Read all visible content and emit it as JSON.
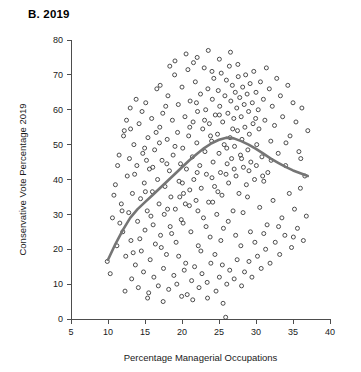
{
  "panel": {
    "title": "B. 2019"
  },
  "chart_data": {
    "type": "scatter",
    "title": "B. 2019",
    "xlabel": "Percentage Managerial Occupations",
    "ylabel": "Conservative Vote Percentage 2019",
    "xlim": [
      5,
      40
    ],
    "ylim": [
      0,
      80
    ],
    "xticks": [
      5,
      10,
      15,
      20,
      25,
      30,
      35,
      40
    ],
    "yticks": [
      0,
      10,
      20,
      30,
      40,
      50,
      60,
      70,
      80
    ],
    "grid": false,
    "legend": null,
    "marker": {
      "shape": "open-circle",
      "size": 4,
      "stroke_color": "#3a3a3a",
      "fill": "none"
    },
    "trend_line": {
      "label": "loess-smoother",
      "color": "#757575",
      "width": 2.6,
      "points": [
        [
          10.0,
          17.0
        ],
        [
          11.0,
          21.5
        ],
        [
          12.0,
          25.5
        ],
        [
          13.0,
          29.0
        ],
        [
          14.0,
          31.5
        ],
        [
          15.0,
          33.5
        ],
        [
          16.0,
          35.5
        ],
        [
          17.0,
          37.5
        ],
        [
          18.0,
          39.5
        ],
        [
          19.0,
          41.5
        ],
        [
          20.0,
          43.5
        ],
        [
          21.0,
          45.5
        ],
        [
          22.0,
          47.3
        ],
        [
          23.0,
          49.0
        ],
        [
          24.0,
          50.4
        ],
        [
          25.0,
          51.4
        ],
        [
          26.0,
          52.0
        ],
        [
          27.0,
          51.8
        ],
        [
          28.0,
          51.0
        ],
        [
          29.0,
          50.0
        ],
        [
          30.0,
          48.8
        ],
        [
          31.0,
          47.4
        ],
        [
          32.0,
          46.0
        ],
        [
          33.0,
          44.8
        ],
        [
          34.0,
          43.6
        ],
        [
          35.0,
          42.6
        ],
        [
          36.0,
          41.8
        ],
        [
          37.0,
          41.0
        ]
      ]
    },
    "points": [
      [
        9.9,
        16.5
      ],
      [
        10.3,
        13.0
      ],
      [
        10.6,
        29.0
      ],
      [
        11.0,
        38.5
      ],
      [
        11.2,
        21.0
      ],
      [
        11.5,
        47.0
      ],
      [
        11.8,
        33.0
      ],
      [
        12.0,
        25.0
      ],
      [
        12.2,
        54.0
      ],
      [
        12.4,
        18.0
      ],
      [
        12.6,
        41.0
      ],
      [
        12.8,
        30.5
      ],
      [
        13.0,
        60.5
      ],
      [
        13.1,
        22.5
      ],
      [
        13.3,
        36.0
      ],
      [
        13.5,
        50.0
      ],
      [
        13.7,
        15.5
      ],
      [
        13.9,
        44.0
      ],
      [
        14.0,
        28.0
      ],
      [
        14.2,
        56.0
      ],
      [
        14.4,
        34.5
      ],
      [
        14.5,
        19.5
      ],
      [
        14.7,
        47.5
      ],
      [
        14.9,
        39.0
      ],
      [
        15.0,
        25.5
      ],
      [
        15.1,
        62.0
      ],
      [
        15.3,
        31.0
      ],
      [
        15.4,
        52.0
      ],
      [
        15.6,
        43.0
      ],
      [
        15.7,
        17.0
      ],
      [
        15.9,
        57.5
      ],
      [
        16.0,
        36.5
      ],
      [
        16.1,
        27.0
      ],
      [
        16.3,
        48.5
      ],
      [
        16.4,
        21.5
      ],
      [
        16.6,
        66.0
      ],
      [
        16.7,
        40.0
      ],
      [
        16.9,
        33.0
      ],
      [
        17.0,
        55.0
      ],
      [
        17.1,
        24.0
      ],
      [
        17.3,
        45.5
      ],
      [
        17.4,
        59.0
      ],
      [
        17.6,
        30.0
      ],
      [
        17.7,
        38.0
      ],
      [
        17.9,
        18.5
      ],
      [
        18.0,
        51.5
      ],
      [
        18.1,
        64.0
      ],
      [
        18.3,
        42.5
      ],
      [
        18.4,
        26.5
      ],
      [
        18.5,
        35.0
      ],
      [
        18.7,
        57.0
      ],
      [
        18.8,
        47.0
      ],
      [
        19.0,
        70.0
      ],
      [
        19.1,
        31.5
      ],
      [
        19.2,
        22.0
      ],
      [
        19.4,
        53.5
      ],
      [
        19.5,
        61.5
      ],
      [
        19.6,
        39.5
      ],
      [
        19.8,
        44.5
      ],
      [
        19.9,
        28.5
      ],
      [
        20.0,
        66.5
      ],
      [
        20.1,
        49.0
      ],
      [
        20.2,
        36.0
      ],
      [
        20.4,
        58.0
      ],
      [
        20.5,
        16.0
      ],
      [
        20.6,
        43.0
      ],
      [
        20.8,
        71.5
      ],
      [
        20.9,
        52.5
      ],
      [
        21.0,
        32.5
      ],
      [
        21.1,
        62.5
      ],
      [
        21.2,
        25.0
      ],
      [
        21.4,
        46.5
      ],
      [
        21.5,
        56.5
      ],
      [
        21.6,
        40.0
      ],
      [
        21.8,
        68.0
      ],
      [
        21.9,
        34.0
      ],
      [
        22.0,
        50.5
      ],
      [
        22.1,
        59.5
      ],
      [
        22.2,
        21.0
      ],
      [
        22.4,
        44.0
      ],
      [
        22.5,
        64.5
      ],
      [
        22.6,
        37.5
      ],
      [
        22.8,
        54.5
      ],
      [
        22.9,
        29.0
      ],
      [
        23.0,
        72.0
      ],
      [
        23.1,
        48.0
      ],
      [
        23.2,
        60.0
      ],
      [
        23.3,
        41.5
      ],
      [
        23.5,
        66.0
      ],
      [
        23.6,
        33.5
      ],
      [
        23.7,
        56.0
      ],
      [
        23.8,
        23.5
      ],
      [
        24.0,
        51.0
      ],
      [
        24.1,
        63.0
      ],
      [
        24.2,
        45.0
      ],
      [
        24.3,
        69.0
      ],
      [
        24.4,
        38.0
      ],
      [
        24.5,
        58.5
      ],
      [
        24.7,
        30.0
      ],
      [
        24.8,
        53.0
      ],
      [
        24.9,
        65.5
      ],
      [
        25.0,
        47.5
      ],
      [
        25.1,
        61.0
      ],
      [
        25.2,
        42.0
      ],
      [
        25.3,
        70.5
      ],
      [
        25.4,
        35.5
      ],
      [
        25.5,
        56.5
      ],
      [
        25.6,
        26.0
      ],
      [
        25.7,
        50.0
      ],
      [
        25.8,
        64.0
      ],
      [
        25.9,
        0.5
      ],
      [
        26.0,
        68.5
      ],
      [
        26.1,
        44.5
      ],
      [
        26.2,
        59.0
      ],
      [
        26.3,
        39.0
      ],
      [
        26.4,
        72.5
      ],
      [
        26.5,
        52.0
      ],
      [
        26.6,
        62.5
      ],
      [
        26.7,
        46.0
      ],
      [
        26.8,
        67.0
      ],
      [
        26.9,
        31.0
      ],
      [
        27.0,
        57.5
      ],
      [
        27.1,
        49.5
      ],
      [
        27.2,
        65.0
      ],
      [
        27.3,
        41.0
      ],
      [
        27.4,
        60.5
      ],
      [
        27.5,
        54.0
      ],
      [
        27.6,
        69.5
      ],
      [
        27.7,
        36.0
      ],
      [
        27.8,
        63.5
      ],
      [
        27.9,
        47.0
      ],
      [
        28.0,
        58.0
      ],
      [
        28.1,
        51.5
      ],
      [
        28.2,
        66.5
      ],
      [
        28.3,
        43.5
      ],
      [
        28.4,
        61.5
      ],
      [
        28.5,
        55.0
      ],
      [
        28.6,
        70.0
      ],
      [
        28.7,
        38.5
      ],
      [
        28.8,
        64.5
      ],
      [
        28.9,
        48.5
      ],
      [
        29.0,
        59.5
      ],
      [
        29.1,
        53.0
      ],
      [
        29.2,
        67.5
      ],
      [
        29.3,
        45.0
      ],
      [
        29.5,
        62.0
      ],
      [
        29.6,
        56.0
      ],
      [
        29.7,
        71.0
      ],
      [
        29.8,
        40.0
      ],
      [
        30.0,
        65.0
      ],
      [
        30.1,
        50.0
      ],
      [
        30.3,
        60.0
      ],
      [
        30.4,
        54.5
      ],
      [
        30.6,
        68.0
      ],
      [
        30.8,
        46.5
      ],
      [
        31.0,
        63.0
      ],
      [
        31.2,
        57.0
      ],
      [
        31.4,
        72.0
      ],
      [
        31.6,
        42.0
      ],
      [
        31.8,
        66.0
      ],
      [
        32.0,
        51.0
      ],
      [
        32.2,
        61.0
      ],
      [
        32.5,
        55.5
      ],
      [
        32.8,
        69.0
      ],
      [
        33.0,
        47.5
      ],
      [
        33.3,
        64.0
      ],
      [
        33.6,
        58.0
      ],
      [
        34.0,
        44.0
      ],
      [
        34.3,
        67.0
      ],
      [
        34.6,
        52.5
      ],
      [
        35.0,
        62.0
      ],
      [
        35.4,
        56.5
      ],
      [
        35.8,
        48.0
      ],
      [
        36.2,
        60.5
      ],
      [
        36.6,
        41.0
      ],
      [
        37.0,
        54.0
      ],
      [
        12.3,
        8.0
      ],
      [
        13.2,
        11.5
      ],
      [
        14.1,
        9.0
      ],
      [
        14.8,
        13.5
      ],
      [
        15.5,
        7.5
      ],
      [
        16.2,
        12.0
      ],
      [
        16.8,
        9.5
      ],
      [
        17.5,
        14.5
      ],
      [
        18.2,
        8.5
      ],
      [
        18.9,
        12.5
      ],
      [
        19.3,
        10.0
      ],
      [
        20.3,
        14.0
      ],
      [
        20.7,
        7.0
      ],
      [
        21.3,
        11.0
      ],
      [
        21.7,
        15.0
      ],
      [
        22.3,
        9.0
      ],
      [
        22.7,
        13.0
      ],
      [
        23.4,
        10.5
      ],
      [
        23.9,
        16.0
      ],
      [
        24.6,
        8.0
      ],
      [
        25.05,
        12.0
      ],
      [
        25.45,
        15.5
      ],
      [
        26.05,
        10.0
      ],
      [
        26.45,
        14.0
      ],
      [
        27.05,
        11.5
      ],
      [
        27.45,
        17.0
      ],
      [
        28.05,
        9.5
      ],
      [
        28.45,
        13.5
      ],
      [
        29.05,
        16.5
      ],
      [
        29.45,
        12.0
      ],
      [
        30.2,
        18.0
      ],
      [
        30.7,
        14.5
      ],
      [
        31.3,
        20.0
      ],
      [
        31.9,
        16.0
      ],
      [
        32.6,
        22.0
      ],
      [
        33.2,
        18.5
      ],
      [
        33.9,
        24.0
      ],
      [
        34.8,
        20.5
      ],
      [
        35.6,
        26.0
      ],
      [
        36.4,
        22.5
      ],
      [
        11.3,
        44.0
      ],
      [
        12.1,
        52.5
      ],
      [
        13.4,
        19.0
      ],
      [
        13.8,
        63.0
      ],
      [
        14.3,
        23.0
      ],
      [
        15.2,
        45.5
      ],
      [
        15.8,
        29.5
      ],
      [
        16.5,
        53.5
      ],
      [
        17.2,
        20.5
      ],
      [
        17.8,
        61.0
      ],
      [
        18.6,
        24.5
      ],
      [
        19.7,
        35.0
      ],
      [
        20.15,
        27.5
      ],
      [
        21.05,
        37.0
      ],
      [
        22.15,
        31.0
      ],
      [
        23.25,
        26.5
      ],
      [
        24.15,
        33.5
      ],
      [
        25.25,
        22.5
      ],
      [
        26.25,
        28.0
      ],
      [
        27.25,
        24.0
      ],
      [
        28.25,
        30.5
      ],
      [
        29.25,
        25.0
      ],
      [
        30.5,
        32.0
      ],
      [
        31.5,
        27.0
      ],
      [
        32.3,
        34.0
      ],
      [
        33.5,
        29.0
      ],
      [
        34.5,
        36.0
      ],
      [
        35.2,
        31.5
      ],
      [
        36.0,
        37.5
      ],
      [
        19.05,
        74.0
      ],
      [
        20.55,
        76.0
      ],
      [
        22.05,
        75.0
      ],
      [
        23.55,
        77.0
      ],
      [
        25.05,
        74.5
      ],
      [
        26.55,
        76.5
      ],
      [
        18.35,
        72.5
      ],
      [
        21.55,
        73.5
      ],
      [
        24.05,
        71.0
      ],
      [
        27.55,
        73.0
      ],
      [
        10.8,
        35.5
      ],
      [
        11.6,
        27.5
      ],
      [
        12.9,
        46.0
      ],
      [
        14.6,
        59.5
      ],
      [
        16.05,
        43.5
      ],
      [
        17.05,
        67.0
      ],
      [
        18.05,
        31.5
      ],
      [
        19.05,
        49.5
      ],
      [
        20.05,
        39.0
      ],
      [
        21.05,
        55.0
      ],
      [
        22.05,
        42.0
      ],
      [
        23.05,
        57.0
      ],
      [
        24.05,
        40.5
      ],
      [
        25.05,
        58.5
      ],
      [
        26.05,
        49.0
      ],
      [
        27.05,
        43.0
      ],
      [
        28.05,
        46.0
      ],
      [
        29.05,
        42.5
      ],
      [
        30.05,
        44.0
      ],
      [
        31.05,
        39.5
      ],
      [
        12.5,
        57.0
      ],
      [
        13.6,
        41.5
      ],
      [
        15.05,
        36.5
      ],
      [
        16.95,
        50.5
      ],
      [
        20.45,
        33.0
      ],
      [
        23.85,
        52.5
      ],
      [
        24.85,
        36.5
      ],
      [
        26.85,
        54.5
      ],
      [
        28.85,
        35.0
      ],
      [
        30.9,
        41.0
      ],
      [
        11.9,
        31.0
      ],
      [
        13.05,
        54.5
      ],
      [
        14.95,
        49.0
      ],
      [
        17.95,
        44.5
      ],
      [
        21.95,
        62.0
      ],
      [
        25.95,
        41.5
      ],
      [
        29.95,
        57.5
      ],
      [
        32.05,
        45.5
      ],
      [
        34.05,
        50.5
      ],
      [
        36.05,
        46.0
      ],
      [
        19.55,
        18.0
      ],
      [
        22.55,
        19.5
      ],
      [
        24.45,
        18.5
      ],
      [
        27.95,
        21.0
      ],
      [
        21.45,
        5.5
      ],
      [
        23.45,
        6.0
      ],
      [
        25.55,
        4.5
      ],
      [
        19.95,
        6.5
      ],
      [
        17.45,
        5.0
      ],
      [
        15.35,
        6.0
      ],
      [
        29.85,
        22.0
      ],
      [
        31.05,
        24.5
      ],
      [
        33.05,
        26.5
      ],
      [
        35.05,
        23.5
      ],
      [
        36.8,
        29.5
      ]
    ]
  }
}
